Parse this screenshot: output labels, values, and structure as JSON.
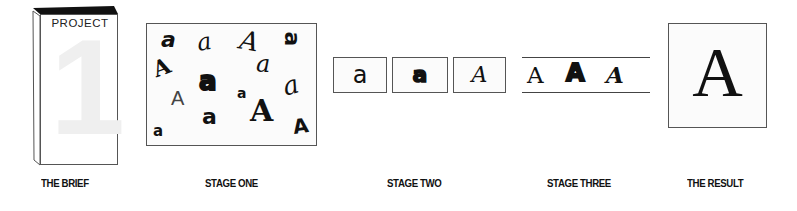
{
  "brief": {
    "book_label": "PROJECT",
    "book_number": "1",
    "caption": "THE BRIEF"
  },
  "stage_one": {
    "caption": "STAGE ONE",
    "glyphs": [
      {
        "char": "a",
        "x": 14,
        "y": 5,
        "size": 22,
        "style": "sans-bold-italic",
        "rotate": 0
      },
      {
        "char": "a",
        "x": 50,
        "y": 8,
        "size": 22,
        "style": "script",
        "rotate": -10
      },
      {
        "char": "A",
        "x": 93,
        "y": 5,
        "size": 26,
        "style": "script",
        "rotate": 10
      },
      {
        "char": "a",
        "x": 134,
        "y": 3,
        "size": 24,
        "style": "sans-rotated",
        "rotate": 90
      },
      {
        "char": "A",
        "x": 6,
        "y": 33,
        "size": 22,
        "style": "bold-serif",
        "rotate": -20
      },
      {
        "char": "a",
        "x": 109,
        "y": 30,
        "size": 22,
        "style": "script",
        "rotate": 0
      },
      {
        "char": "a",
        "x": 53,
        "y": 46,
        "size": 24,
        "style": "heavy",
        "rotate": 0
      },
      {
        "char": "a",
        "x": 134,
        "y": 50,
        "size": 24,
        "style": "script",
        "rotate": -15
      },
      {
        "char": "A",
        "x": 25,
        "y": 65,
        "size": 20,
        "style": "thin",
        "rotate": 0
      },
      {
        "char": "a",
        "x": 90,
        "y": 62,
        "size": 14,
        "style": "bold",
        "rotate": 0
      },
      {
        "char": "a",
        "x": 55,
        "y": 83,
        "size": 22,
        "style": "sans",
        "rotate": 0
      },
      {
        "char": "A",
        "x": 105,
        "y": 75,
        "size": 30,
        "style": "bold-serif",
        "rotate": 0
      },
      {
        "char": "A",
        "x": 145,
        "y": 92,
        "size": 20,
        "style": "bold",
        "rotate": -10
      },
      {
        "char": "a",
        "x": 6,
        "y": 100,
        "size": 16,
        "style": "sans-bold",
        "rotate": 0
      }
    ]
  },
  "stage_two": {
    "caption": "STAGE TWO",
    "boxes": [
      {
        "char": "a",
        "style": "sans"
      },
      {
        "char": "a",
        "style": "heavy"
      },
      {
        "char": "A",
        "style": "serif-italic"
      }
    ]
  },
  "stage_three": {
    "caption": "STAGE THREE",
    "glyphs": [
      {
        "char": "A",
        "style": "serif"
      },
      {
        "char": "A",
        "style": "heavy"
      },
      {
        "char": "A",
        "style": "serif-italic-bold"
      }
    ]
  },
  "result": {
    "caption": "THE RESULT",
    "char": "A"
  }
}
